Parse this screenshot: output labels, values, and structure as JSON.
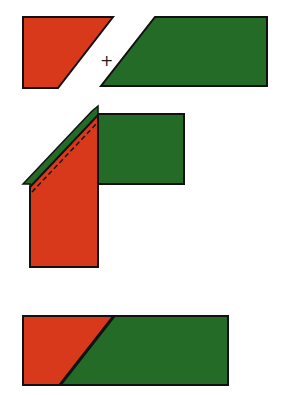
{
  "diagram": {
    "colors": {
      "red": "#d9391b",
      "green": "#246b28",
      "outline": "#111111",
      "background": "#ffffff"
    },
    "steps": [
      {
        "id": "step-1",
        "label": "Two separate angled pieces",
        "operator": "+"
      },
      {
        "id": "step-2",
        "label": "Pieces placed right sides together at right angle, stitch line dashed"
      },
      {
        "id": "step-3",
        "label": "Joined strip with diagonal seam"
      }
    ]
  }
}
